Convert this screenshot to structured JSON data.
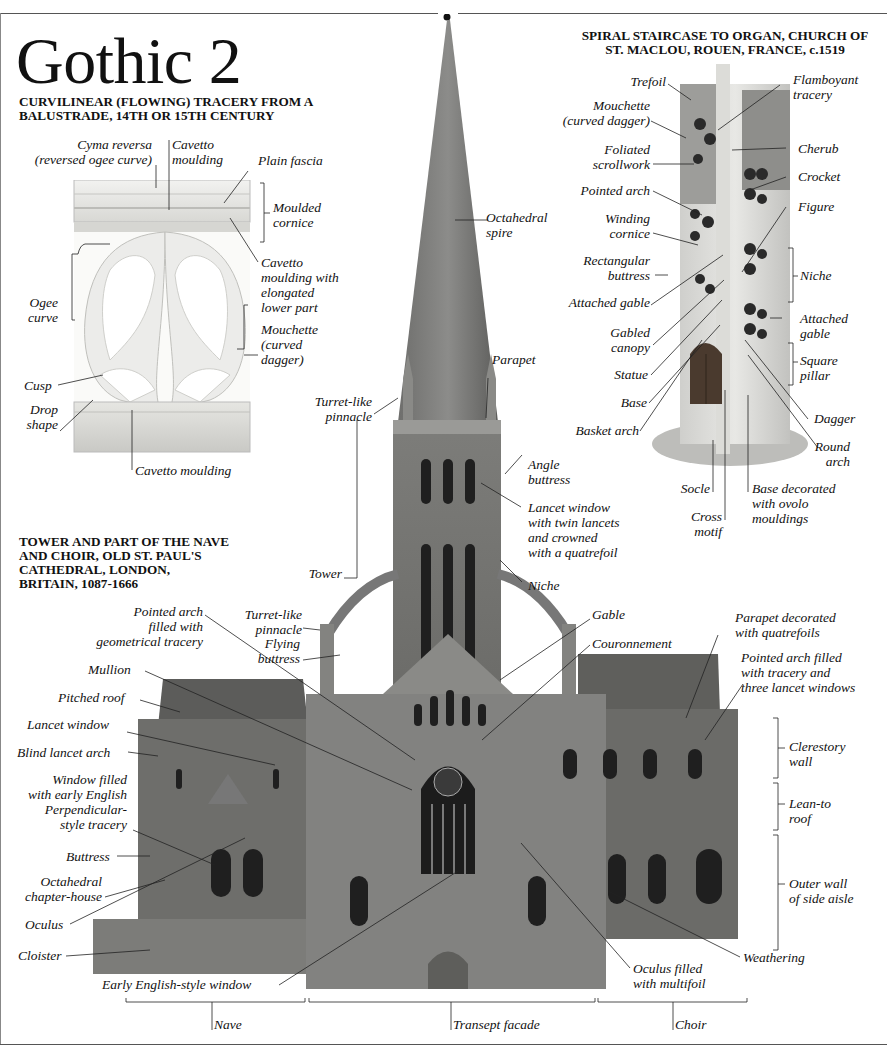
{
  "page": {
    "title": "Gothic 2",
    "footer_page_marker": ""
  },
  "balustrade": {
    "heading": "CURVILINEAR (FLOWING) TRACERY FROM A\nBALUSTRADE, 14TH OR 15TH CENTURY",
    "labels": {
      "cyma_reversa": "Cyma reversa\n(reversed ogee curve)",
      "cavetto_top": "Cavetto\nmoulding",
      "plain_fascia": "Plain fascia",
      "moulded_cornice": "Moulded\ncornice",
      "cavetto_elongated": "Cavetto\nmoulding with\nelongated\nlower part",
      "ogee_curve": "Ogee\ncurve",
      "mouchette": "Mouchette\n(curved\ndagger)",
      "cusp": "Cusp",
      "drop_shape": "Drop\nshape",
      "cavetto_bottom": "Cavetto moulding"
    }
  },
  "staircase": {
    "heading": "SPIRAL STAIRCASE TO ORGAN, CHURCH OF\nST. MACLOU, ROUEN, FRANCE, c.1519",
    "labels": {
      "trefoil": "Trefoil",
      "mouchette": "Mouchette\n(curved dagger)",
      "foliated_scrollwork": "Foliated\nscrollwork",
      "pointed_arch": "Pointed arch",
      "winding_cornice": "Winding\ncornice",
      "rectangular_buttress": "Rectangular\nbuttress",
      "attached_gable_left": "Attached gable",
      "gabled_canopy": "Gabled\ncanopy",
      "statue": "Statue",
      "base": "Base",
      "basket_arch": "Basket arch",
      "flamboyant_tracery": "Flamboyant\ntracery",
      "cherub": "Cherub",
      "crocket": "Crocket",
      "figure": "Figure",
      "niche": "Niche",
      "attached_gable_right": "Attached\ngable",
      "square_pillar": "Square\npillar",
      "dagger": "Dagger",
      "round_arch": "Round\narch",
      "socle": "Socle",
      "cross_motif": "Cross\nmotif",
      "base_decorated": "Base decorated\nwith ovolo\nmouldings"
    }
  },
  "cathedral": {
    "heading": "TOWER AND PART OF THE NAVE\nAND CHOIR, OLD ST. PAUL'S\nCATHEDRAL, LONDON,\nBRITAIN, 1087-1666",
    "labels": {
      "octahedral_spire": "Octahedral\nspire",
      "parapet": "Parapet",
      "turret_pinnacle_top": "Turret-like\npinnacle",
      "angle_buttress": "Angle\nbuttress",
      "lancet_twin": "Lancet window\nwith twin lancets\nand crowned\nwith a quatrefoil",
      "niche": "Niche",
      "tower": "Tower",
      "turret_pinnacle_low": "Turret-like\npinnacle",
      "pointed_arch_geometrical": "Pointed arch\nfilled with\ngeometrical tracery",
      "flying_buttress": "Flying\nbuttress",
      "mullion": "Mullion",
      "pitched_roof": "Pitched roof",
      "lancet_window": "Lancet window",
      "blind_lancet_arch": "Blind lancet arch",
      "window_early_english": "Window filled\nwith early English\nPerpendicular-\nstyle tracery",
      "buttress": "Buttress",
      "octahedral_chapter_house": "Octahedral\nchapter-house",
      "oculus": "Oculus",
      "cloister": "Cloister",
      "early_english_window": "Early English-style window",
      "gable": "Gable",
      "couronnement": "Couronnement",
      "parapet_quatrefoils": "Parapet decorated\nwith quatrefoils",
      "pointed_arch_three_lancet": "Pointed arch filled\nwith tracery and\nthree lancet windows",
      "clerestory_wall": "Clerestory\nwall",
      "lean_to_roof": "Lean-to\nroof",
      "outer_wall": "Outer wall\nof side aisle",
      "weathering": "Weathering",
      "oculus_multifoil": "Oculus filled\nwith multifoil",
      "nave": "Nave",
      "transept_facade": "Transept facade",
      "choir": "Choir"
    }
  }
}
